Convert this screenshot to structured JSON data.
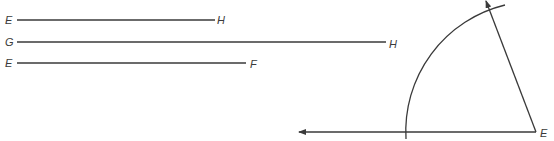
{
  "diagram": {
    "type": "geometric construction",
    "segments": [
      {
        "id": "EH",
        "start_label": "E",
        "end_label": "H"
      },
      {
        "id": "GH",
        "start_label": "G",
        "end_label": "H"
      },
      {
        "id": "EF",
        "start_label": "E",
        "end_label": "F"
      }
    ],
    "construction": {
      "vertex_label": "E",
      "description": "Arc of radius centered at vertex E, intersecting a horizontal ray and a slanted ray"
    }
  },
  "colors": {
    "stroke": "#3a3a3a",
    "background": "#ffffff"
  }
}
